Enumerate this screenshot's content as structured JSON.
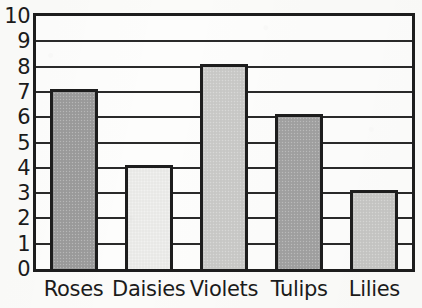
{
  "chart_data": {
    "type": "bar",
    "title": "",
    "title_note": "title is cropped off the top edge of the scan and is illegible",
    "xlabel": "",
    "ylabel": "",
    "categories": [
      "Roses",
      "Daisies",
      "Violets",
      "Tulips",
      "Lilies"
    ],
    "values": [
      7,
      4,
      8,
      6,
      3
    ],
    "ylim": [
      0,
      10
    ],
    "ytick_labels": [
      "0",
      "1",
      "2",
      "3",
      "4",
      "5",
      "6",
      "7",
      "8",
      "9",
      "10"
    ],
    "ytick_values": [
      0,
      1,
      2,
      3,
      4,
      5,
      6,
      7,
      8,
      9,
      10
    ],
    "grid": true,
    "grid_axis": "y",
    "legend": false,
    "legend_position": "none",
    "bar_colors": [
      "#9d9d9d",
      "#ececea",
      "#cbcbc9",
      "#a3a3a3",
      "#c8c8c6"
    ],
    "bar_edge_color": "#1d1d1d",
    "plot_background": "#fdfdfc",
    "axis_color": "#1d1d1d",
    "page_background": "#fbfbf9"
  },
  "axis": {
    "y_ticks": [
      {
        "label": "10",
        "value": 10
      },
      {
        "label": "9",
        "value": 9
      },
      {
        "label": "8",
        "value": 8
      },
      {
        "label": "7",
        "value": 7
      },
      {
        "label": "6",
        "value": 6
      },
      {
        "label": "5",
        "value": 5
      },
      {
        "label": "4",
        "value": 4
      },
      {
        "label": "3",
        "value": 3
      },
      {
        "label": "2",
        "value": 2
      },
      {
        "label": "1",
        "value": 1
      },
      {
        "label": "0",
        "value": 0
      }
    ],
    "x_ticks": [
      {
        "label": "Roses"
      },
      {
        "label": "Daisies"
      },
      {
        "label": "Violets"
      },
      {
        "label": "Tulips"
      },
      {
        "label": "Lilies"
      }
    ]
  }
}
